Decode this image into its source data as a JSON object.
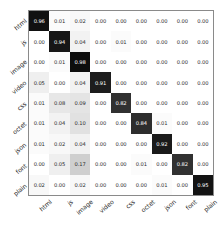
{
  "chart_data": {
    "type": "heatmap",
    "title": "",
    "xlabel": "",
    "ylabel": "",
    "colormap": "greys",
    "value_range": [
      0.0,
      1.0
    ],
    "grid": false,
    "legend": "none",
    "annotations": "every cell labeled with 2-decimal value",
    "categories": [
      "html",
      "js",
      "image",
      "video",
      "css",
      "octet",
      "json",
      "font",
      "plain"
    ],
    "x_tick_labels": [
      "html",
      "js",
      "image",
      "video",
      "css",
      "octet",
      "json",
      "font",
      "plain"
    ],
    "y_tick_labels": [
      "html",
      "js",
      "image",
      "video",
      "css",
      "octet",
      "json",
      "font",
      "plain"
    ],
    "rows": [
      {
        "label": "html",
        "values": [
          0.96,
          0.01,
          0.02,
          0.0,
          0.0,
          0.0,
          0.0,
          0.0,
          0.0
        ]
      },
      {
        "label": "js",
        "values": [
          0.0,
          0.94,
          0.04,
          0.0,
          0.01,
          0.0,
          0.0,
          0.0,
          0.0
        ]
      },
      {
        "label": "image",
        "values": [
          0.0,
          0.01,
          0.98,
          0.0,
          0.0,
          0.0,
          0.0,
          0.0,
          0.0
        ]
      },
      {
        "label": "video",
        "values": [
          0.05,
          0.0,
          0.04,
          0.91,
          0.0,
          0.0,
          0.0,
          0.0,
          0.0
        ]
      },
      {
        "label": "css",
        "values": [
          0.01,
          0.08,
          0.09,
          0.0,
          0.82,
          0.0,
          0.0,
          0.0,
          0.0
        ]
      },
      {
        "label": "octet",
        "values": [
          0.01,
          0.04,
          0.1,
          0.0,
          0.0,
          0.84,
          0.01,
          0.0,
          0.0
        ]
      },
      {
        "label": "json",
        "values": [
          0.01,
          0.02,
          0.04,
          0.0,
          0.0,
          0.0,
          0.92,
          0.0,
          0.0
        ]
      },
      {
        "label": "font",
        "values": [
          0.0,
          0.05,
          0.17,
          0.0,
          0.0,
          0.01,
          0.0,
          0.82,
          0.0
        ]
      },
      {
        "label": "plain",
        "values": [
          0.02,
          0.0,
          0.02,
          0.0,
          0.0,
          0.0,
          0.01,
          0.0,
          0.95
        ]
      }
    ]
  }
}
